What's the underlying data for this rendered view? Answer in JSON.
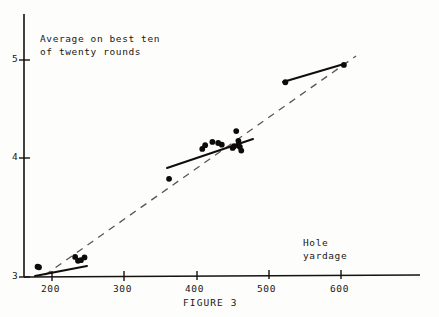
{
  "figure": {
    "caption": "FIGURE 3",
    "y_axis_title_line1": "Average on best ten",
    "y_axis_title_line2": "of twenty rounds",
    "x_axis_title_line1": "Hole",
    "x_axis_title_line2": "yardage"
  },
  "axes": {
    "y_ticks": [
      "5",
      "4",
      "3"
    ],
    "x_ticks": [
      "200",
      "300",
      "400",
      "500",
      "600"
    ]
  },
  "colors": {
    "axis": "#15120f",
    "point": "#0d0b09",
    "group_fit": "#100d0a",
    "overall_fit": "#5b5650",
    "paper": "#fdfdfb"
  },
  "chart_data": {
    "type": "scatter",
    "title": "FIGURE 3",
    "xlabel": "Hole yardage",
    "ylabel": "Average on best ten of twenty rounds",
    "xlim": [
      160,
      700
    ],
    "ylim": [
      3,
      5.15
    ],
    "x_ticks": [
      200,
      300,
      400,
      500,
      600
    ],
    "y_ticks": [
      3,
      4,
      5
    ],
    "grid": false,
    "legend": "none",
    "series": [
      {
        "name": "Par 3 holes",
        "x": [
          180,
          182,
          232,
          236,
          240,
          245
        ],
        "y": [
          3.095,
          3.09,
          3.185,
          3.15,
          3.155,
          3.18
        ]
      },
      {
        "name": "Par 4 holes",
        "x": [
          362,
          408,
          412,
          422,
          430,
          435,
          450,
          452,
          455,
          458,
          458,
          460,
          462
        ],
        "y": [
          3.905,
          4.18,
          4.215,
          4.245,
          4.235,
          4.22,
          4.19,
          4.205,
          4.345,
          4.255,
          4.215,
          4.2,
          4.165
        ]
      },
      {
        "name": "Par 5 holes",
        "x": [
          523,
          604
        ],
        "y": [
          4.795,
          4.955
        ]
      }
    ],
    "fit_lines": [
      {
        "name": "Par 3 within-group fit",
        "style": "solid",
        "x": [
          176,
          248
        ],
        "y": [
          3.085,
          3.18
        ]
      },
      {
        "name": "Par 4 within-group fit",
        "style": "solid",
        "x": [
          359,
          478
        ],
        "y": [
          4.0,
          4.265
        ]
      },
      {
        "name": "Par 5 within-group fit",
        "style": "solid",
        "x": [
          521,
          606
        ],
        "y": [
          4.795,
          4.96
        ]
      },
      {
        "name": "Overall fit (all holes)",
        "style": "dashed",
        "x": [
          190,
          620
        ],
        "y": [
          3.02,
          5.03
        ]
      }
    ]
  }
}
